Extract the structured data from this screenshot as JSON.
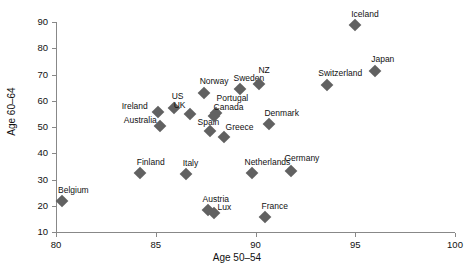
{
  "chart_data": {
    "type": "scatter",
    "title": "",
    "xlabel": "Age 50–54",
    "ylabel": "Age 60–64",
    "xlim": [
      80,
      100
    ],
    "ylim": [
      10,
      90
    ],
    "xticks": [
      80,
      85,
      90,
      95,
      100
    ],
    "yticks": [
      10,
      20,
      30,
      40,
      50,
      60,
      70,
      80,
      90
    ],
    "grid": false,
    "legend": null,
    "marker": "diamond",
    "marker_color": "#616161",
    "points": [
      {
        "label": "Belgium",
        "x": 80.3,
        "y": 21.8,
        "lx": -4,
        "ly": -15
      },
      {
        "label": "Finland",
        "x": 84.2,
        "y": 32.5,
        "lx": -3,
        "ly": -15
      },
      {
        "label": "Ireland",
        "x": 85.1,
        "y": 55.6,
        "lx": -36,
        "ly": -10
      },
      {
        "label": "Australia",
        "x": 85.2,
        "y": 50.4,
        "lx": -36,
        "ly": -10
      },
      {
        "label": "US",
        "x": 85.9,
        "y": 57.4,
        "lx": -2,
        "ly": -16
      },
      {
        "label": "Italy",
        "x": 86.5,
        "y": 32.0,
        "lx": -3,
        "ly": -15
      },
      {
        "label": "UK",
        "x": 86.7,
        "y": 55.1,
        "lx": -16,
        "ly": -13
      },
      {
        "label": "Norway",
        "x": 87.4,
        "y": 63.1,
        "lx": -4,
        "ly": -16
      },
      {
        "label": "Austria",
        "x": 87.6,
        "y": 18.2,
        "lx": -5,
        "ly": -15
      },
      {
        "label": "Spain",
        "x": 87.7,
        "y": 48.6,
        "lx": -12,
        "ly": -13
      },
      {
        "label": "Portugal",
        "x": 88.0,
        "y": 55.2,
        "lx": 1,
        "ly": -19
      },
      {
        "label": "Canada",
        "x": 87.9,
        "y": 54.3,
        "lx": 0,
        "ly": -13
      },
      {
        "label": "Lux",
        "x": 87.9,
        "y": 17.3,
        "lx": 4,
        "ly": -10
      },
      {
        "label": "Greece",
        "x": 88.4,
        "y": 46.3,
        "lx": 2,
        "ly": -14
      },
      {
        "label": "Sweden",
        "x": 89.2,
        "y": 64.6,
        "lx": -6,
        "ly": -15
      },
      {
        "label": "Netherlands",
        "x": 89.8,
        "y": 32.4,
        "lx": -7,
        "ly": -15
      },
      {
        "label": "NZ",
        "x": 90.2,
        "y": 66.4,
        "lx": -1,
        "ly": -18
      },
      {
        "label": "France",
        "x": 90.5,
        "y": 15.7,
        "lx": -4,
        "ly": -15
      },
      {
        "label": "Denmark",
        "x": 90.7,
        "y": 51.2,
        "lx": -5,
        "ly": -15
      },
      {
        "label": "Germany",
        "x": 91.8,
        "y": 33.2,
        "lx": -7,
        "ly": -17
      },
      {
        "label": "Switzerland",
        "x": 93.6,
        "y": 66.0,
        "lx": -9,
        "ly": -16
      },
      {
        "label": "Iceland",
        "x": 95.0,
        "y": 89.0,
        "lx": -4,
        "ly": -15
      },
      {
        "label": "Japan",
        "x": 96.0,
        "y": 71.4,
        "lx": -4,
        "ly": -16
      }
    ]
  }
}
